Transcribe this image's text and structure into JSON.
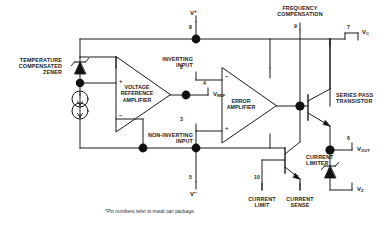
{
  "diagram": {
    "footnote": "*Pin numbers refer to metal can package.",
    "line_color": "#1a1a1a",
    "fill_color": "#111111",
    "background": "#ffffff"
  },
  "labels": {
    "temperature_zener": "TEMPERATURE\nCOMPENSATED\nZENER",
    "voltage_reference_amplifier": "VOLTAGE\nREFERENCE\nAMPLIFIER",
    "error_amplifier": "ERROR\nAMPLIFIER",
    "inverting_input": "INVERTING\nINPUT",
    "non_inverting_input": "NON-INVERTING\nINPUT",
    "frequency_compensation": "FREQUENCY\nCOMPENSATION",
    "series_pass_transistor": "SERIES PASS\nTRANSISTOR",
    "current_limiter": "CURRENT\nLIMITER",
    "current_limit": "CURRENT\nLIMIT",
    "current_sense": "CURRENT\nSENSE"
  },
  "pins": {
    "v_plus": {
      "number": "8",
      "name": "V+"
    },
    "v_minus": {
      "number": "5",
      "name": "V−"
    },
    "v_ref": {
      "number": "4",
      "name": "VREF"
    },
    "inverting": {
      "number": "2"
    },
    "non_inverting": {
      "number": "3"
    },
    "freq_comp": {
      "number": "9"
    },
    "v_c": {
      "number": "7",
      "name": "VC"
    },
    "v_out": {
      "number": "6",
      "name": "VOUT"
    },
    "v_z": {
      "name": "VZ"
    },
    "current_limit": {
      "number": "10"
    },
    "current_sense": {
      "number": "1"
    }
  },
  "amp_signs": {
    "error_minus": "−",
    "error_plus": "+",
    "vref_minus": "−",
    "vref_plus": "+"
  }
}
